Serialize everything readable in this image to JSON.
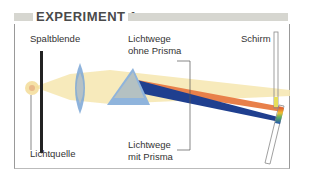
{
  "header": {
    "title": "EXPERIMENT 1"
  },
  "labels": {
    "spaltblende": "Spaltblende",
    "lichtquelle": "Lichtquelle",
    "ohne_prisma_line1": "Lichtwege",
    "ohne_prisma_line2": "ohne Prisma",
    "mit_prisma_line1": "Lichtwege",
    "mit_prisma_line2": "mit Prisma",
    "schirm": "Schirm"
  },
  "colors": {
    "light_beam": "#f6e8b4",
    "lens": "#7aa6d6",
    "prisma": "#8fb4dc",
    "orange_beam": "#e8804a",
    "blue_beam": "#1f3f8f",
    "header_bar": "#d6d6d0"
  }
}
